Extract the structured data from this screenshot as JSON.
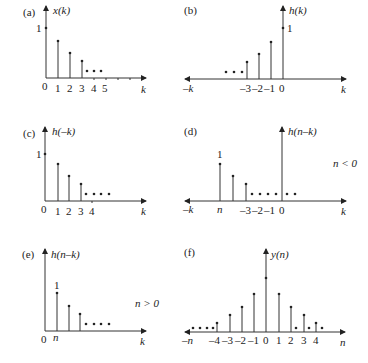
{
  "panels": {
    "a": {
      "tag": "(a)",
      "ylabel": "x(k)",
      "xlabel": "k",
      "unit_label": "1",
      "ticks": [
        "0",
        "1",
        "2",
        "3",
        "4",
        "5"
      ]
    },
    "b": {
      "tag": "(b)",
      "ylabel": "h(k)",
      "xlabel": "k",
      "left_label": "–k",
      "unit_label": "1",
      "ticks": [
        "–3",
        "–2",
        "–1",
        "0"
      ]
    },
    "c": {
      "tag": "(c)",
      "ylabel": "h(–k)",
      "xlabel": "k",
      "unit_label": "1",
      "ticks": [
        "0",
        "1",
        "2",
        "3",
        "4"
      ]
    },
    "d": {
      "tag": "(d)",
      "ylabel": "h(n–k)",
      "xlabel": "k",
      "left_label": "–k",
      "unit_label": "1",
      "n_label": "n",
      "condition": "n < 0",
      "ticks": [
        "–3",
        "–2",
        "–1",
        "0"
      ]
    },
    "e": {
      "tag": "(e)",
      "ylabel": "h(n–k)",
      "xlabel": "k",
      "unit_label": "1",
      "origin_label": "0",
      "n_label": "n",
      "condition": "n > 0"
    },
    "f": {
      "tag": "(f)",
      "ylabel": "y(n)",
      "xlabel": "n",
      "left_label": "–n",
      "ticks": [
        "–4",
        "–3",
        "–2",
        "–1",
        "0",
        "1",
        "2",
        "3",
        "4"
      ]
    }
  }
}
